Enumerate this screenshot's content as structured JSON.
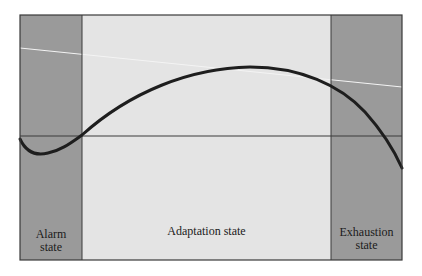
{
  "diagram": {
    "colors": {
      "frame": "#3a3a3a",
      "dark_region": "#9a9a9a",
      "light_region": "#e4e4e4",
      "curve": "#1e1e1e",
      "baseline": "#3a3a3a",
      "faint_line": "#f2f2f2"
    },
    "regions": [
      {
        "id": "alarm",
        "line1": "Alarm",
        "line2": "state"
      },
      {
        "id": "adaptation",
        "line1": "Adaptation state"
      },
      {
        "id": "exhaustion",
        "line1": "Exhaustion",
        "line2": "state"
      }
    ]
  }
}
